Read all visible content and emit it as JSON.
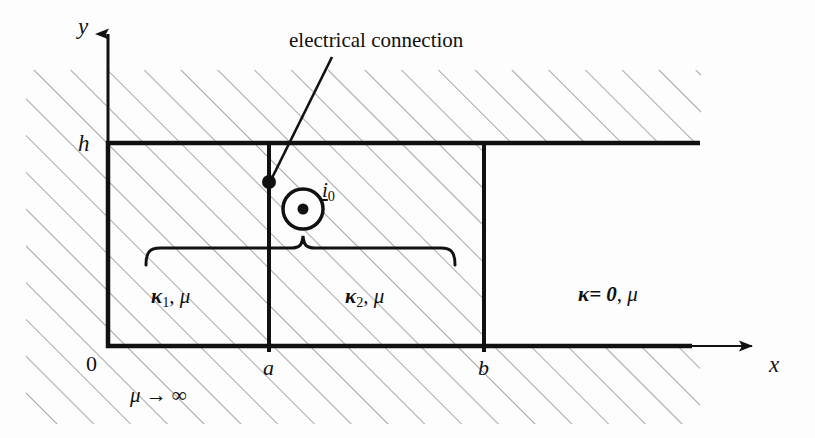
{
  "figure": {
    "axes": {
      "y_label": "y",
      "x_label": "x",
      "origin_label": "0",
      "height_label": "h",
      "a_label": "a",
      "b_label": "b"
    },
    "annotations": {
      "electrical_connection": "electrical connection",
      "current_source": "i",
      "current_source_subscript": "0",
      "permeability_core": "μ → ∞"
    },
    "regions": [
      {
        "name": "region-1",
        "conductivity": "κ",
        "conductivity_subscript": "1",
        "permeability": "μ",
        "label": "κ1, μ",
        "x_from": "0",
        "x_to": "a"
      },
      {
        "name": "region-2",
        "conductivity": "κ",
        "conductivity_subscript": "2",
        "permeability": "μ",
        "label": "κ2, μ",
        "x_from": "a",
        "x_to": "b"
      },
      {
        "name": "region-3",
        "conductivity": "κ= 0",
        "permeability": "μ",
        "label": "κ= 0, μ",
        "x_from": "b",
        "x_to": "∞"
      }
    ],
    "colors": {
      "line": "#111111",
      "hatch": "#888888",
      "background": "#fdfdfd"
    },
    "graphics": {
      "hatching": "45-degree up-right thin gray lines",
      "brace": "horizontal curly brace under regions 1 and 2",
      "current_symbol": "circle with center dot (current out of page)",
      "connection_dot": "filled black dot at x=a on top conductor"
    }
  }
}
